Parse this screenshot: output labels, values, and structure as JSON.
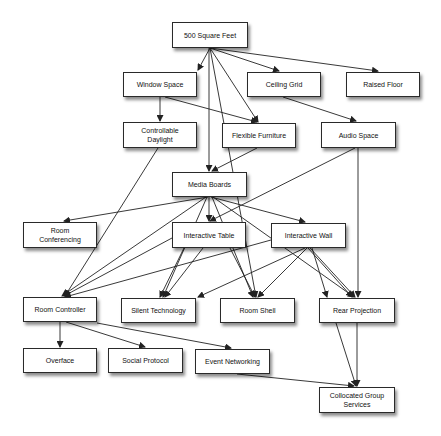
{
  "diagram": {
    "nodes": [
      {
        "id": "sqft",
        "label": "500 Square Feet",
        "x": 172,
        "y": 22,
        "w": 76,
        "h": 26
      },
      {
        "id": "window",
        "label": "Window Space",
        "x": 123,
        "y": 72,
        "w": 74,
        "h": 25
      },
      {
        "id": "ceiling",
        "label": "Ceiling Grid",
        "x": 247,
        "y": 72,
        "w": 74,
        "h": 25
      },
      {
        "id": "raised",
        "label": "Raised Floor",
        "x": 346,
        "y": 72,
        "w": 74,
        "h": 25
      },
      {
        "id": "daylight",
        "label": "Controllable Daylight",
        "x": 123,
        "y": 122,
        "w": 74,
        "h": 26
      },
      {
        "id": "furniture",
        "label": "Flexible Furniture",
        "x": 222,
        "y": 123,
        "w": 74,
        "h": 25
      },
      {
        "id": "audio",
        "label": "Audio Space",
        "x": 321,
        "y": 122,
        "w": 75,
        "h": 26
      },
      {
        "id": "media",
        "label": "Media Boards",
        "x": 172,
        "y": 172,
        "w": 75,
        "h": 25
      },
      {
        "id": "conferencing",
        "label": "Room Conferencing",
        "x": 23,
        "y": 222,
        "w": 74,
        "h": 26
      },
      {
        "id": "table",
        "label": "Interactive Table",
        "x": 172,
        "y": 222,
        "w": 74,
        "h": 26
      },
      {
        "id": "wall",
        "label": "Interactive Wall",
        "x": 271,
        "y": 223,
        "w": 75,
        "h": 25
      },
      {
        "id": "controller",
        "label": "Room Controller",
        "x": 23,
        "y": 297,
        "w": 74,
        "h": 25
      },
      {
        "id": "silent",
        "label": "Silent Technology",
        "x": 121,
        "y": 298,
        "w": 75,
        "h": 25
      },
      {
        "id": "shell",
        "label": "Room Shell",
        "x": 220,
        "y": 298,
        "w": 75,
        "h": 25
      },
      {
        "id": "rear",
        "label": "Rear Projection",
        "x": 319,
        "y": 298,
        "w": 76,
        "h": 25
      },
      {
        "id": "overface",
        "label": "Overface",
        "x": 23,
        "y": 348,
        "w": 74,
        "h": 25
      },
      {
        "id": "social",
        "label": "Social Protocol",
        "x": 108,
        "y": 348,
        "w": 75,
        "h": 25
      },
      {
        "id": "event",
        "label": "Event Networking",
        "x": 195,
        "y": 349,
        "w": 75,
        "h": 25
      },
      {
        "id": "collocated",
        "label": "Collocated Group Services",
        "x": 319,
        "y": 387,
        "w": 76,
        "h": 26
      }
    ],
    "edges": [
      {
        "from": "sqft",
        "to": "window",
        "path": [
          [
            210,
            48
          ],
          [
            198,
            70
          ]
        ]
      },
      {
        "from": "sqft",
        "to": "ceiling",
        "path": [
          [
            210,
            48
          ],
          [
            279,
            71
          ]
        ]
      },
      {
        "from": "sqft",
        "to": "raised",
        "path": [
          [
            210,
            48
          ],
          [
            378,
            71
          ]
        ]
      },
      {
        "from": "sqft",
        "to": "furniture",
        "path": [
          [
            210,
            48
          ],
          [
            258,
            122
          ]
        ]
      },
      {
        "from": "sqft",
        "to": "media",
        "path": [
          [
            209,
            48
          ],
          [
            209,
            171
          ]
        ]
      },
      {
        "from": "sqft",
        "to": "shell",
        "path": [
          [
            210,
            48
          ],
          [
            256,
            297
          ]
        ]
      },
      {
        "from": "window",
        "to": "daylight",
        "path": [
          [
            160,
            97
          ],
          [
            160,
            121
          ]
        ]
      },
      {
        "from": "window",
        "to": "furniture",
        "path": [
          [
            165,
            97
          ],
          [
            257,
            122
          ]
        ]
      },
      {
        "from": "ceiling",
        "to": "audio",
        "path": [
          [
            283,
            97
          ],
          [
            356,
            121
          ]
        ]
      },
      {
        "from": "furniture",
        "to": "media",
        "path": [
          [
            257,
            148
          ],
          [
            212,
            171
          ]
        ]
      },
      {
        "from": "daylight",
        "to": "controller",
        "path": [
          [
            158,
            148
          ],
          [
            65,
            296
          ]
        ]
      },
      {
        "from": "audio",
        "to": "table",
        "path": [
          [
            355,
            148
          ],
          [
            210,
            221
          ]
        ]
      },
      {
        "from": "audio",
        "to": "rear",
        "path": [
          [
            358,
            148
          ],
          [
            358,
            297
          ]
        ]
      },
      {
        "from": "media",
        "to": "conferencing",
        "path": [
          [
            208,
            197
          ],
          [
            64,
            221
          ]
        ]
      },
      {
        "from": "media",
        "to": "table",
        "path": [
          [
            209,
            197
          ],
          [
            209,
            221
          ]
        ]
      },
      {
        "from": "media",
        "to": "wall",
        "path": [
          [
            211,
            197
          ],
          [
            305,
            222
          ]
        ]
      },
      {
        "from": "media",
        "to": "controller",
        "path": [
          [
            206,
            197
          ],
          [
            62,
            296
          ]
        ]
      },
      {
        "from": "media",
        "to": "silent",
        "path": [
          [
            207,
            197
          ],
          [
            163,
            297
          ]
        ]
      },
      {
        "from": "media",
        "to": "shell",
        "path": [
          [
            212,
            197
          ],
          [
            253,
            297
          ]
        ]
      },
      {
        "from": "media",
        "to": "rear",
        "path": [
          [
            213,
            197
          ],
          [
            354,
            297
          ]
        ]
      },
      {
        "from": "table",
        "to": "controller",
        "path": [
          [
            172,
            238
          ],
          [
            64,
            296
          ]
        ]
      },
      {
        "from": "table",
        "to": "silent",
        "path": [
          [
            184,
            248
          ],
          [
            160,
            297
          ]
        ]
      },
      {
        "from": "table",
        "to": "silent",
        "path": [
          [
            203,
            248
          ],
          [
            165,
            297
          ]
        ]
      },
      {
        "from": "table",
        "to": "shell",
        "path": [
          [
            230,
            248
          ],
          [
            255,
            297
          ]
        ]
      },
      {
        "from": "wall",
        "to": "controller",
        "path": [
          [
            271,
            240
          ],
          [
            65,
            297
          ]
        ]
      },
      {
        "from": "wall",
        "to": "silent",
        "path": [
          [
            305,
            248
          ],
          [
            198,
            297
          ]
        ]
      },
      {
        "from": "wall",
        "to": "shell",
        "path": [
          [
            307,
            248
          ],
          [
            258,
            297
          ]
        ]
      },
      {
        "from": "wall",
        "to": "rear",
        "path": [
          [
            308,
            248
          ],
          [
            352,
            297
          ]
        ]
      },
      {
        "from": "wall",
        "to": "rear",
        "path": [
          [
            310,
            248
          ],
          [
            355,
            297
          ]
        ]
      },
      {
        "from": "wall",
        "to": "collocated",
        "path": [
          [
            312,
            248
          ],
          [
            327,
            297
          ]
        ]
      },
      {
        "from": "controller",
        "to": "overface",
        "path": [
          [
            60,
            322
          ],
          [
            60,
            347
          ]
        ]
      },
      {
        "from": "controller",
        "to": "social",
        "path": [
          [
            66,
            322
          ],
          [
            145,
            347
          ]
        ]
      },
      {
        "from": "controller",
        "to": "event",
        "path": [
          [
            97,
            323
          ],
          [
            231,
            348
          ]
        ]
      },
      {
        "from": "event",
        "to": "collocated",
        "path": [
          [
            237,
            374
          ],
          [
            354,
            386
          ]
        ]
      },
      {
        "from": "rear",
        "to": "collocated",
        "path": [
          [
            336,
            323
          ],
          [
            356,
            386
          ]
        ]
      },
      {
        "from": "rear",
        "to": "collocated",
        "path": [
          [
            357,
            323
          ],
          [
            357,
            386
          ]
        ]
      }
    ],
    "colors": {
      "edge": "#222222",
      "node_border": "#2a2a2a",
      "node_fill": "#ffffff",
      "text": "#111111"
    }
  }
}
